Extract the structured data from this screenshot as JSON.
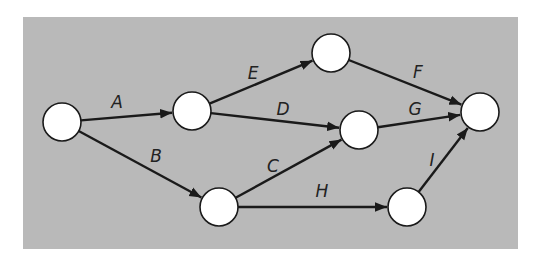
{
  "diagram": {
    "type": "activity-on-arrow network",
    "background_color": "#b9b9b9",
    "node_fill": "#ffffff",
    "line_color": "#1a1a1a",
    "panel": {
      "x": 23,
      "y": 17,
      "width": 495,
      "height": 232
    },
    "nodes": [
      {
        "id": "n1",
        "x": 62,
        "y": 122,
        "r": 19
      },
      {
        "id": "n2",
        "x": 192,
        "y": 111,
        "r": 19
      },
      {
        "id": "n3",
        "x": 331,
        "y": 53,
        "r": 19
      },
      {
        "id": "n4",
        "x": 359,
        "y": 130,
        "r": 19
      },
      {
        "id": "n5",
        "x": 480,
        "y": 112,
        "r": 19
      },
      {
        "id": "n6",
        "x": 219,
        "y": 207,
        "r": 19
      },
      {
        "id": "n7",
        "x": 407,
        "y": 207,
        "r": 19
      }
    ],
    "edges": [
      {
        "label": "A",
        "from": "n1",
        "to": "n2",
        "lx": 117,
        "ly": 103
      },
      {
        "label": "B",
        "from": "n1",
        "to": "n6",
        "lx": 156,
        "ly": 157
      },
      {
        "label": "E",
        "from": "n2",
        "to": "n3",
        "lx": 253,
        "ly": 74
      },
      {
        "label": "D",
        "from": "n2",
        "to": "n4",
        "lx": 283,
        "ly": 110
      },
      {
        "label": "C",
        "from": "n6",
        "to": "n4",
        "lx": 273,
        "ly": 167
      },
      {
        "label": "H",
        "from": "n6",
        "to": "n7",
        "lx": 322,
        "ly": 192
      },
      {
        "label": "F",
        "from": "n3",
        "to": "n5",
        "lx": 418,
        "ly": 73
      },
      {
        "label": "G",
        "from": "n4",
        "to": "n5",
        "lx": 415,
        "ly": 110
      },
      {
        "label": "I",
        "from": "n7",
        "to": "n5",
        "lx": 432,
        "ly": 161
      }
    ]
  }
}
